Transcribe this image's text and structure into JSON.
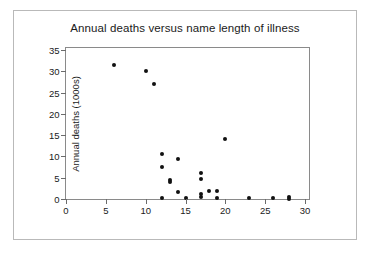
{
  "figure": {
    "width": 371,
    "height": 256,
    "background_color": "#ffffff",
    "border_color": "#b9b9b9"
  },
  "chart_data": {
    "type": "scatter",
    "title": "Annual deaths versus name length of illness",
    "xlabel": "Name length",
    "ylabel": "Annual deaths (1000s)",
    "xlim": [
      0,
      30.5
    ],
    "ylim": [
      0,
      35.5
    ],
    "xticks": [
      0,
      5,
      10,
      15,
      20,
      25,
      30
    ],
    "xtick_labels": [
      "0",
      "5",
      "10",
      "15",
      "20",
      "25",
      "30"
    ],
    "yticks": [
      0,
      5,
      10,
      15,
      20,
      25,
      30,
      35
    ],
    "ytick_labels": [
      "0",
      "5",
      "10",
      "15",
      "20",
      "25",
      "30",
      "35"
    ],
    "grid": false,
    "legend": null,
    "marker_color": "#111111",
    "marker_size": 4,
    "n_points": 27,
    "points": [
      {
        "x": 6,
        "y": 31.5
      },
      {
        "x": 10,
        "y": 30.0
      },
      {
        "x": 11,
        "y": 27.0
      },
      {
        "x": 12,
        "y": 10.5
      },
      {
        "x": 12,
        "y": 7.5
      },
      {
        "x": 12,
        "y": 0.2
      },
      {
        "x": 13,
        "y": 4.5
      },
      {
        "x": 13,
        "y": 4.0
      },
      {
        "x": 14,
        "y": 9.4
      },
      {
        "x": 14,
        "y": 1.6
      },
      {
        "x": 15,
        "y": 0.2
      },
      {
        "x": 17,
        "y": 6.2
      },
      {
        "x": 17,
        "y": 4.7
      },
      {
        "x": 17,
        "y": 1.1
      },
      {
        "x": 17,
        "y": 0.5
      },
      {
        "x": 18,
        "y": 1.8
      },
      {
        "x": 19,
        "y": 1.9
      },
      {
        "x": 19,
        "y": 0.3
      },
      {
        "x": 20,
        "y": 14.2
      },
      {
        "x": 23,
        "y": 0.2
      },
      {
        "x": 26,
        "y": 0.2
      },
      {
        "x": 28,
        "y": 0.5
      },
      {
        "x": 28,
        "y": 0.1
      }
    ]
  }
}
